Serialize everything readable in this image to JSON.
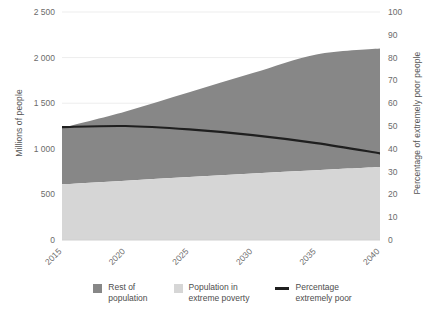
{
  "chart_data": {
    "type": "area",
    "title": "",
    "subtitle": "",
    "xlabel": "",
    "ylabel": "Millions of people",
    "ylabel_right": "Percentage of extremely poor people",
    "x": [
      2015,
      2020,
      2025,
      2030,
      2035,
      2040
    ],
    "xlim": [
      2015,
      2040
    ],
    "ylim": [
      0,
      2500
    ],
    "ylim_right": [
      0,
      100
    ],
    "grid": true,
    "grid_axis": "y",
    "legend_position": "bottom",
    "xtick_labels": [
      "2015",
      "2020",
      "2025",
      "2030",
      "2035",
      "2040"
    ],
    "ytick_labels": [
      "0",
      "500",
      "1 000",
      "1 500",
      "2 000",
      "2 500"
    ],
    "ytick_values": [
      0,
      500,
      1000,
      1500,
      2000,
      2500
    ],
    "ytick_labels_right": [
      "0",
      "10",
      "20",
      "30",
      "40",
      "50",
      "60",
      "70",
      "80",
      "90",
      "100"
    ],
    "ytick_values_right": [
      0,
      10,
      20,
      30,
      40,
      50,
      60,
      70,
      80,
      90,
      100
    ],
    "series": [
      {
        "name": "Population in extreme poverty",
        "type": "area",
        "axis": "left",
        "color": "#d6d6d6",
        "x": [
          2015,
          2020,
          2025,
          2030,
          2035,
          2040
        ],
        "values": [
          610,
          650,
          690,
          730,
          765,
          800
        ]
      },
      {
        "name": "Rest of population",
        "type": "area",
        "axis": "left",
        "color": "#878787",
        "x": [
          2015,
          2020,
          2025,
          2030,
          2035,
          2040
        ],
        "values": [
          620,
          760,
          930,
          1100,
          1270,
          1300
        ],
        "cumulative_top": [
          1230,
          1410,
          1620,
          1830,
          2035,
          2100
        ]
      },
      {
        "name": "Percentage extremely poor",
        "type": "line",
        "axis": "right",
        "color": "#1f1f1f",
        "x": [
          2015,
          2020,
          2025,
          2030,
          2035,
          2040
        ],
        "values": [
          49.5,
          50.0,
          48.5,
          46.0,
          42.5,
          38.0
        ]
      }
    ]
  },
  "legend": {
    "items": [
      {
        "label": "Rest of\npopulation",
        "marker": "swatch",
        "color": "#878787"
      },
      {
        "label": "Population in\nextreme poverty",
        "marker": "swatch",
        "color": "#d6d6d6"
      },
      {
        "label": "Percentage\nextremely poor",
        "marker": "line",
        "color": "#1f1f1f"
      }
    ]
  },
  "axes": {
    "left_title": "Millions of people",
    "right_title": "Percentage of extremely poor people"
  }
}
